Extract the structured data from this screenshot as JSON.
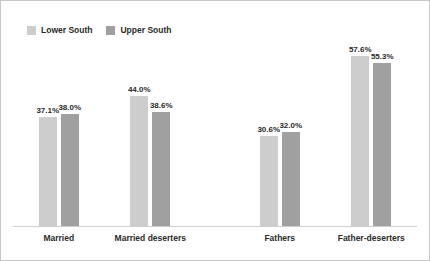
{
  "chart_data": {
    "type": "bar",
    "title": "",
    "subtitle": "",
    "xlabel": "",
    "ylabel": "",
    "grid": false,
    "legend_position": "top-left",
    "ylim": [
      0,
      62
    ],
    "axis_visible": "baseline-only",
    "categories": [
      "Married",
      "Married deserters",
      "Fathers",
      "Father-deserters"
    ],
    "series": [
      {
        "name": "Lower South",
        "color": "#cdcdcd",
        "values": [
          37.1,
          38.0,
          30.6,
          57.6
        ],
        "labels": [
          "37.1%",
          "38.0%",
          "30.6%",
          "57.6%"
        ]
      },
      {
        "name": "Upper South",
        "color": "#a0a0a0",
        "values": [
          38.0,
          38.6,
          32.0,
          55.3
        ],
        "labels": [
          "38.0%",
          "38.6%",
          "32.0%",
          "55.3%"
        ]
      }
    ],
    "group_labels": [
      {
        "category": "Married",
        "lower_south": "37.1%",
        "upper_south": "38.0%"
      },
      {
        "category": "Married deserters",
        "lower_south": "44.0%",
        "upper_south": "38.6%"
      },
      {
        "category": "Fathers",
        "lower_south": "30.6%",
        "upper_south": "32.0%"
      },
      {
        "category": "Father-deserters",
        "lower_south": "57.6%",
        "upper_south": "55.3%"
      }
    ],
    "bars": [
      {
        "group": "Married",
        "series": "Lower South",
        "value": 37.1,
        "label": "37.1%"
      },
      {
        "group": "Married",
        "series": "Upper South",
        "value": 38.0,
        "label": "38.0%"
      },
      {
        "group": "Married deserters",
        "series": "Lower South",
        "value": 44.0,
        "label": "44.0%"
      },
      {
        "group": "Married deserters",
        "series": "Upper South",
        "value": 38.6,
        "label": "38.6%"
      },
      {
        "group": "Fathers",
        "series": "Lower South",
        "value": 30.6,
        "label": "30.6%"
      },
      {
        "group": "Fathers",
        "series": "Upper South",
        "value": 32.0,
        "label": "32.0%"
      },
      {
        "group": "Father-deserters",
        "series": "Lower South",
        "value": 57.6,
        "label": "57.6%"
      },
      {
        "group": "Father-deserters",
        "series": "Upper South",
        "value": 55.3,
        "label": "55.3%"
      }
    ]
  },
  "legend": {
    "items": [
      {
        "label": "Lower South",
        "color": "#cdcdcd"
      },
      {
        "label": "Upper South",
        "color": "#a0a0a0"
      }
    ]
  },
  "colors": {
    "lower_south": "#cdcdcd",
    "upper_south": "#a0a0a0",
    "text": "#2b2b2b",
    "axis": "#cfcfcf",
    "border": "#c8c8c8",
    "background": "#ffffff"
  }
}
